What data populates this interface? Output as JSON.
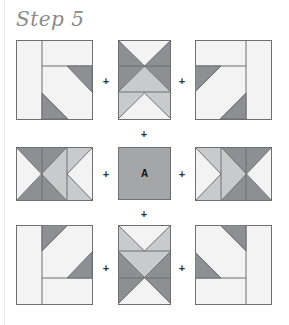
{
  "title": "Step 5",
  "center_label": "A",
  "plus_symbol": "+",
  "colors": {
    "light": "#f3f3f4",
    "medium": "#c9cacc",
    "dark": "#8e8f92",
    "center": "#a5a6a8",
    "stroke": "#6f6f72"
  },
  "layout": {
    "rows": 3,
    "cols": 3,
    "blocks": [
      {
        "id": "top-left",
        "type": "corner-block"
      },
      {
        "id": "top-center",
        "type": "hourglass-strip"
      },
      {
        "id": "top-right",
        "type": "corner-block"
      },
      {
        "id": "middle-left",
        "type": "hourglass-strip-horizontal"
      },
      {
        "id": "middle-center",
        "type": "center-square",
        "label": "A"
      },
      {
        "id": "middle-right",
        "type": "hourglass-strip-horizontal"
      },
      {
        "id": "bottom-left",
        "type": "corner-block"
      },
      {
        "id": "bottom-center",
        "type": "hourglass-strip"
      },
      {
        "id": "bottom-right",
        "type": "corner-block"
      }
    ]
  }
}
